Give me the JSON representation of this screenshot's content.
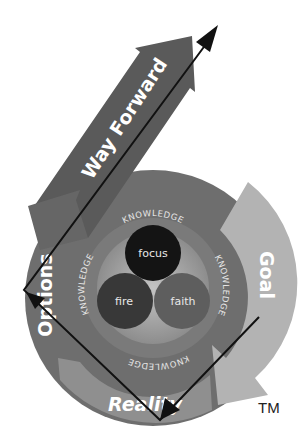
{
  "diagram": {
    "stages": {
      "way_forward": "Way Forward",
      "options": "Options",
      "goal": "Goal",
      "reality": "Reality"
    },
    "ring_labels": [
      "KNOWLEDGE",
      "KNOWLEDGE",
      "KNOWLEDGE",
      "KNOWLEDGE"
    ],
    "core": {
      "top": "focus",
      "left": "fire",
      "right": "faith"
    },
    "trademark": "TM",
    "colors": {
      "outer_ring": "#6e6e6e",
      "way_forward_arrow": "#5f5f5f",
      "goal_arrow": "#b0b0b0",
      "reality_arrow": "#8c8c8c",
      "knowledge_ring": "#7a7a7a",
      "core_bg": "#a9a9a9",
      "focus": "#141414",
      "fire": "#3a3a3a",
      "faith": "#5c5c5c",
      "path_line": "#111111"
    }
  }
}
